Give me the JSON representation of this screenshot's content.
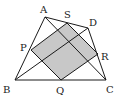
{
  "diagram": {
    "points": {
      "A": {
        "label": "A"
      },
      "B": {
        "label": "B"
      },
      "C": {
        "label": "C"
      },
      "D": {
        "label": "D"
      },
      "P": {
        "label": "P"
      },
      "Q": {
        "label": "Q"
      },
      "R": {
        "label": "R"
      },
      "S": {
        "label": "S"
      }
    },
    "shaded_region": "PQRS",
    "segments": [
      "AB",
      "AD",
      "DC",
      "BC",
      "BD",
      "AC",
      "PQ",
      "QR",
      "RS",
      "SP"
    ],
    "colors": {
      "line": "#1a1a1a",
      "shade": "#c8c8c8"
    }
  }
}
